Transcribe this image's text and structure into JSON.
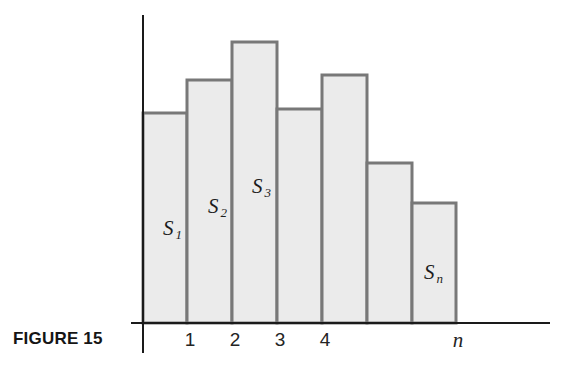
{
  "figure": {
    "caption": "FIGURE 15",
    "background_color": "#ffffff",
    "axis_color": "#1a1a1a",
    "bar_fill_color": "#ebebeb",
    "bar_border_color": "#787878"
  },
  "axes": {
    "y_axis": {
      "x": 143,
      "y_top": 15,
      "y_bottom": 353
    },
    "x_axis": {
      "y": 323,
      "x_left": 131,
      "x_right": 550
    }
  },
  "x_tick_labels": [
    {
      "text": "1",
      "x": 190,
      "italic": false
    },
    {
      "text": "2",
      "x": 235,
      "italic": false
    },
    {
      "text": "3",
      "x": 280,
      "italic": false
    },
    {
      "text": "4",
      "x": 325,
      "italic": false
    },
    {
      "text": "n",
      "x": 458,
      "italic": true
    }
  ],
  "area_labels": [
    {
      "symbol": "S",
      "subscript": "1",
      "x": 163,
      "y": 218
    },
    {
      "symbol": "S",
      "subscript": "2",
      "x": 208,
      "y": 196
    },
    {
      "symbol": "S",
      "subscript": "3",
      "x": 252,
      "y": 176
    },
    {
      "symbol": "S",
      "subscript": "n",
      "x": 424,
      "y": 262
    }
  ],
  "chart_data": {
    "type": "bar",
    "title": "FIGURE 15",
    "xlabel": "",
    "ylabel": "",
    "grid": false,
    "legend": null,
    "baseline_y_px": 323,
    "categories": [
      "1",
      "2",
      "3",
      "4",
      "",
      "",
      "n"
    ],
    "values": [
      210,
      243,
      281,
      214,
      248,
      160,
      120
    ],
    "ylim": [
      0,
      308
    ],
    "bars_px": [
      {
        "label": "1",
        "x_left": 143,
        "x_right": 187,
        "y_top": 113
      },
      {
        "label": "2",
        "x_left": 187,
        "x_right": 232,
        "y_top": 80
      },
      {
        "label": "3",
        "x_left": 232,
        "x_right": 277,
        "y_top": 42
      },
      {
        "label": "4",
        "x_left": 277,
        "x_right": 322,
        "y_top": 109
      },
      {
        "label": "",
        "x_left": 322,
        "x_right": 367,
        "y_top": 75
      },
      {
        "label": "",
        "x_left": 367,
        "x_right": 412,
        "y_top": 163
      },
      {
        "label": "n",
        "x_left": 412,
        "x_right": 456,
        "y_top": 203
      }
    ]
  }
}
